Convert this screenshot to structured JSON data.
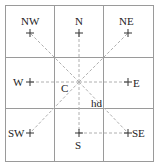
{
  "diagram": {
    "type": "compass-neighborhood-grid",
    "grid": {
      "rows": 3,
      "cols": 3,
      "line_color": "#9a9a9a"
    },
    "center_label": "C",
    "distance_label": "hd",
    "dashed_line_color": "#b0b0b0",
    "directions": [
      {
        "id": "NW",
        "label": "NW"
      },
      {
        "id": "N",
        "label": "N"
      },
      {
        "id": "NE",
        "label": "NE"
      },
      {
        "id": "W",
        "label": "W"
      },
      {
        "id": "E",
        "label": "E"
      },
      {
        "id": "SW",
        "label": "SW"
      },
      {
        "id": "S",
        "label": "S"
      },
      {
        "id": "SE",
        "label": "SE"
      }
    ]
  }
}
